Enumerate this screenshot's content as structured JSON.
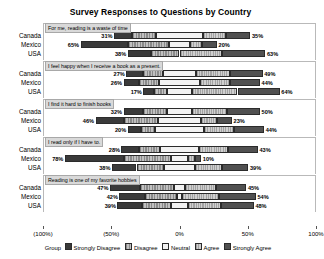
{
  "chart_data": {
    "type": "bar",
    "subtype": "diverging-stacked-likert",
    "title": "Survey Responses to Questions by Country",
    "xlabel": "",
    "ylabel": "",
    "xlim": [
      -100,
      100
    ],
    "grid": false,
    "legend_position": "bottom",
    "legend_title": "Group",
    "categories": [
      "Canada",
      "Mexico",
      "USA"
    ],
    "series": [
      {
        "name": "Strongly Disagree",
        "color": "#3a3a3a"
      },
      {
        "name": "Disagree",
        "color": "#9a9a9a"
      },
      {
        "name": "Neutral",
        "color": "#f2f2f2"
      },
      {
        "name": "Agree",
        "color": "#b0b0b0"
      },
      {
        "name": "Strongly Agree",
        "color": "#505050"
      }
    ],
    "axis_ticks": [
      {
        "value": -100,
        "label": "(100%)"
      },
      {
        "value": -50,
        "label": "(50%)"
      },
      {
        "value": 0,
        "label": "0%"
      },
      {
        "value": 50,
        "label": "50%"
      },
      {
        "value": 100,
        "label": "100%"
      }
    ],
    "panels": [
      {
        "question": "For me, reading is a waste of time",
        "rows": [
          {
            "group": "Canada",
            "left_label": "31%",
            "right_label": "35%",
            "values": [
              13,
              18,
              34,
              17,
              18
            ]
          },
          {
            "group": "Mexico",
            "left_label": "65%",
            "right_label": "20%",
            "values": [
              35,
              30,
              15,
              9,
              11
            ]
          },
          {
            "group": "USA",
            "left_label": "38%",
            "right_label": "63%",
            "values": [
              17,
              21,
              0,
              31,
              32
            ]
          }
        ]
      },
      {
        "question": "I feel happy when I receive a book as a present.",
        "rows": [
          {
            "group": "Canada",
            "left_label": "27%",
            "right_label": "49%",
            "values": [
              12,
              15,
              24,
              25,
              24
            ]
          },
          {
            "group": "Mexico",
            "left_label": "26%",
            "right_label": "44%",
            "values": [
              11,
              15,
              30,
              22,
              22
            ]
          },
          {
            "group": "USA",
            "left_label": "17%",
            "right_label": "64%",
            "values": [
              8,
              9,
              19,
              33,
              31
            ]
          }
        ]
      },
      {
        "question": "I find it hard to finish books",
        "rows": [
          {
            "group": "Canada",
            "left_label": "32%",
            "right_label": "50%",
            "values": [
              14,
              18,
              18,
              26,
              24
            ]
          },
          {
            "group": "Mexico",
            "left_label": "46%",
            "right_label": "23%",
            "values": [
              21,
              25,
              31,
              12,
              11
            ]
          },
          {
            "group": "USA",
            "left_label": "20%",
            "right_label": "44%",
            "values": [
              10,
              10,
              36,
              22,
              22
            ]
          }
        ]
      },
      {
        "question": "I read only if I have to.",
        "rows": [
          {
            "group": "Canada",
            "left_label": "28%",
            "right_label": "43%",
            "values": [
              13,
              15,
              29,
              21,
              22
            ]
          },
          {
            "group": "Mexico",
            "left_label": "78%",
            "right_label": "10%",
            "values": [
              43,
              35,
              12,
              5,
              5
            ]
          },
          {
            "group": "USA",
            "left_label": "38%",
            "right_label": "39%",
            "values": [
              18,
              20,
              23,
              20,
              19
            ]
          }
        ]
      },
      {
        "question": "Reading is one of my favorite hobbies",
        "rows": [
          {
            "group": "Canada",
            "left_label": "47%",
            "right_label": "45%",
            "values": [
              22,
              25,
              8,
              23,
              22
            ]
          },
          {
            "group": "Mexico",
            "left_label": "42%",
            "right_label": "54%",
            "values": [
              19,
              23,
              4,
              27,
              27
            ]
          },
          {
            "group": "USA",
            "left_label": "39%",
            "right_label": "48%",
            "values": [
              18,
              21,
              13,
              24,
              24
            ]
          }
        ]
      }
    ]
  }
}
